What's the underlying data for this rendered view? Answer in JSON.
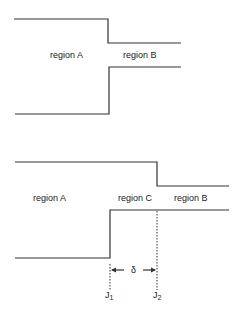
{
  "diagram_top": {
    "labels": {
      "region_a": "region A",
      "region_b": "region B"
    }
  },
  "diagram_bottom": {
    "labels": {
      "region_a": "region A",
      "region_c": "region C",
      "region_b": "region B",
      "delta": "δ",
      "j1": "J",
      "j1_sub": "1",
      "j2": "J",
      "j2_sub": "2"
    }
  },
  "colors": {
    "line": "#333333",
    "text": "#222222",
    "background": "#ffffff"
  }
}
